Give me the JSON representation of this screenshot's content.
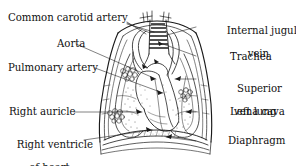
{
  "figure": {
    "kind": "anatomical-line-drawing",
    "style": "black-and-white engraving",
    "ink_color": "#1a1a1a",
    "background_color": "#ffffff",
    "width": 296,
    "height": 166
  },
  "labels": {
    "common_carotid_artery": "Common carotid artery",
    "aorta": "Aorta",
    "pulmonary_artery": "Pulmonary artery",
    "right_auricle": "Right auricle",
    "right_ventricle_line1": "Right ventricle",
    "right_ventricle_line2": "of heart",
    "internal_jugular_line1": "Internal jugular",
    "internal_jugular_line2": "vein",
    "trachea": "Trachea",
    "superior_vena_cava_line1": "Superior",
    "superior_vena_cava_line2": "vena cava",
    "left_lung": "Left lung",
    "diaphragm": "Diaphragm"
  },
  "structures": [
    "chest-wall",
    "trachea-with-cartilage-rings",
    "left-lung",
    "right-lung",
    "heart",
    "aortic-arch",
    "pulmonary-artery",
    "superior-vena-cava",
    "right-auricle",
    "right-ventricle",
    "diaphragm",
    "bronchial-node-clusters"
  ]
}
